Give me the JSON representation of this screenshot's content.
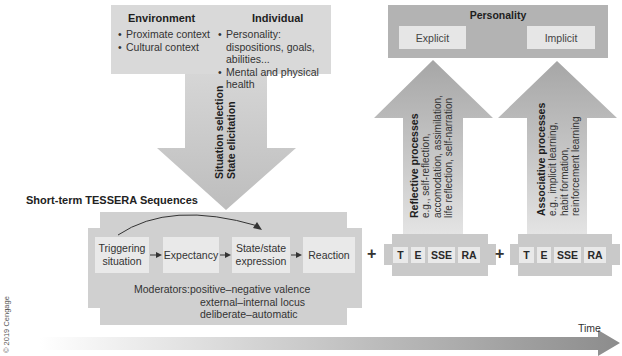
{
  "context_box": {
    "environment": {
      "title": "Environment",
      "items": [
        "Proximate context",
        "Cultural context"
      ]
    },
    "individual": {
      "title": "Individual",
      "items": [
        "Personality: dispositions, goals, abilities...",
        "Mental and physical health"
      ]
    }
  },
  "down_arrow": {
    "line1": "Situation selection",
    "line2": "State elicitation"
  },
  "personality_box": {
    "title": "Personality",
    "explicit": "Explicit",
    "implicit": "Implicit"
  },
  "reflective_arrow": {
    "title": "Reflective processes",
    "line1": "e.g., self-reflection,",
    "line2": "accomodation, assimilation,",
    "line3": "life reflection, self-narration"
  },
  "associative_arrow": {
    "title": "Associative processes",
    "line1": "e.g., implicit learning,",
    "line2": "habit formation,",
    "line3": "reinforcement learning"
  },
  "tessera": {
    "title": "Short-term TESSERA Sequences",
    "steps": [
      "Triggering situation",
      "Expectancy",
      "State/state expression",
      "Reaction"
    ],
    "moderators_label": "Moderators:",
    "moderators": [
      "positive–negative valence",
      "external–internal locus",
      "deliberate–automatic"
    ]
  },
  "plus_sign": "+",
  "mini_sequences": [
    {
      "labels": [
        "T",
        "E",
        "SSE",
        "RA"
      ]
    },
    {
      "labels": [
        "T",
        "E",
        "SSE",
        "RA"
      ]
    }
  ],
  "time_axis": {
    "label": "Time"
  },
  "copyright": "© 2019 Cengage",
  "colors": {
    "context_box": "#d9d9d9",
    "personality_box": "#b3b3b3",
    "arrow_gray": "#c2c2c2",
    "arrow_dark": "#9e9e9e",
    "inner_box": "#e9e9e9",
    "time_arrow_end": "#8f8f8f"
  }
}
